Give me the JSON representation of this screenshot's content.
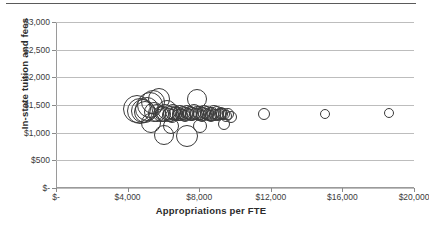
{
  "chart_data": {
    "type": "scatter",
    "title": "",
    "xlabel": "Appropriations per FTE",
    "ylabel": "In-state tuition and fees",
    "xlim": [
      0,
      20000
    ],
    "ylim": [
      0,
      3000
    ],
    "grid": true,
    "legend": null,
    "marker_style": "open-circle-varying-size",
    "xticks": [
      0,
      4000,
      8000,
      12000,
      16000,
      20000
    ],
    "xticklabels": [
      "$-",
      "$4,000",
      "$8,000",
      "$12,000",
      "$16,000",
      "$20,000"
    ],
    "yticks": [
      0,
      500,
      1000,
      1500,
      2000,
      2500,
      3000
    ],
    "yticklabels": [
      "$-",
      "$500",
      "$1,000",
      "$1,500",
      "$2,000",
      "$2,500",
      "$3,000"
    ],
    "points": [
      {
        "x": 4550,
        "y": 1420,
        "r": 14
      },
      {
        "x": 4700,
        "y": 1400,
        "r": 13
      },
      {
        "x": 4850,
        "y": 1390,
        "r": 12
      },
      {
        "x": 4980,
        "y": 1380,
        "r": 11
      },
      {
        "x": 5100,
        "y": 1430,
        "r": 12
      },
      {
        "x": 5250,
        "y": 1500,
        "r": 13
      },
      {
        "x": 5400,
        "y": 1560,
        "r": 12
      },
      {
        "x": 5500,
        "y": 1370,
        "r": 10
      },
      {
        "x": 5620,
        "y": 1350,
        "r": 9
      },
      {
        "x": 5750,
        "y": 1600,
        "r": 11
      },
      {
        "x": 5880,
        "y": 1340,
        "r": 8
      },
      {
        "x": 6000,
        "y": 1330,
        "r": 8
      },
      {
        "x": 6100,
        "y": 1360,
        "r": 9
      },
      {
        "x": 6220,
        "y": 1410,
        "r": 10
      },
      {
        "x": 6300,
        "y": 1320,
        "r": 7
      },
      {
        "x": 6400,
        "y": 1345,
        "r": 8
      },
      {
        "x": 6480,
        "y": 1300,
        "r": 7
      },
      {
        "x": 6560,
        "y": 1375,
        "r": 8
      },
      {
        "x": 6650,
        "y": 1330,
        "r": 7
      },
      {
        "x": 6720,
        "y": 1355,
        "r": 7
      },
      {
        "x": 6800,
        "y": 1315,
        "r": 6
      },
      {
        "x": 6880,
        "y": 1340,
        "r": 7
      },
      {
        "x": 6950,
        "y": 1365,
        "r": 7
      },
      {
        "x": 7020,
        "y": 1325,
        "r": 6
      },
      {
        "x": 7100,
        "y": 1350,
        "r": 7
      },
      {
        "x": 7180,
        "y": 1310,
        "r": 6
      },
      {
        "x": 7250,
        "y": 1340,
        "r": 7
      },
      {
        "x": 7320,
        "y": 1370,
        "r": 7
      },
      {
        "x": 7400,
        "y": 1330,
        "r": 6
      },
      {
        "x": 7470,
        "y": 1355,
        "r": 7
      },
      {
        "x": 7540,
        "y": 1320,
        "r": 6
      },
      {
        "x": 7620,
        "y": 1345,
        "r": 7
      },
      {
        "x": 7700,
        "y": 1380,
        "r": 8
      },
      {
        "x": 7780,
        "y": 1335,
        "r": 6
      },
      {
        "x": 7860,
        "y": 1600,
        "r": 10
      },
      {
        "x": 7900,
        "y": 1355,
        "r": 7
      },
      {
        "x": 7980,
        "y": 1325,
        "r": 6
      },
      {
        "x": 8060,
        "y": 1350,
        "r": 7
      },
      {
        "x": 8140,
        "y": 1310,
        "r": 6
      },
      {
        "x": 8200,
        "y": 1345,
        "r": 7
      },
      {
        "x": 8280,
        "y": 1375,
        "r": 7
      },
      {
        "x": 8360,
        "y": 1330,
        "r": 6
      },
      {
        "x": 8430,
        "y": 1355,
        "r": 7
      },
      {
        "x": 8500,
        "y": 1320,
        "r": 6
      },
      {
        "x": 8580,
        "y": 1345,
        "r": 7
      },
      {
        "x": 8660,
        "y": 1300,
        "r": 6
      },
      {
        "x": 8740,
        "y": 1340,
        "r": 7
      },
      {
        "x": 8820,
        "y": 1365,
        "r": 7
      },
      {
        "x": 8900,
        "y": 1325,
        "r": 6
      },
      {
        "x": 8980,
        "y": 1350,
        "r": 7
      },
      {
        "x": 9060,
        "y": 1315,
        "r": 6
      },
      {
        "x": 9140,
        "y": 1340,
        "r": 6
      },
      {
        "x": 9220,
        "y": 1360,
        "r": 6
      },
      {
        "x": 9300,
        "y": 1330,
        "r": 6
      },
      {
        "x": 9400,
        "y": 1345,
        "r": 6
      },
      {
        "x": 9500,
        "y": 1310,
        "r": 6
      },
      {
        "x": 9620,
        "y": 1335,
        "r": 6
      },
      {
        "x": 9750,
        "y": 1290,
        "r": 6
      },
      {
        "x": 6050,
        "y": 950,
        "r": 10
      },
      {
        "x": 7300,
        "y": 940,
        "r": 11
      },
      {
        "x": 6400,
        "y": 1120,
        "r": 8
      },
      {
        "x": 8050,
        "y": 1120,
        "r": 7
      },
      {
        "x": 9400,
        "y": 1160,
        "r": 6
      },
      {
        "x": 5300,
        "y": 1180,
        "r": 10
      },
      {
        "x": 11600,
        "y": 1340,
        "r": 6
      },
      {
        "x": 15000,
        "y": 1335,
        "r": 5
      },
      {
        "x": 18600,
        "y": 1355,
        "r": 5
      }
    ]
  },
  "axes": {
    "x_title": "Appropriations per FTE",
    "y_title": "In-state tuition and fees"
  }
}
